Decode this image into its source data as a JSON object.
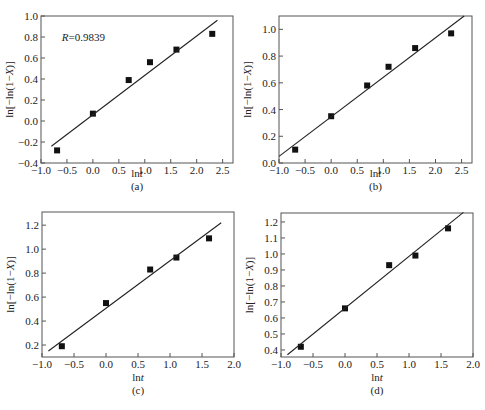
{
  "chart_data": [
    {
      "type": "scatter",
      "panel": "(a)",
      "xlabel": "lnt",
      "ylabel": "ln[−ln(1−X)]",
      "xlim": [
        -1.0,
        2.7
      ],
      "ylim": [
        -0.4,
        1.0
      ],
      "xticks": [
        -1.0,
        -0.5,
        0.0,
        0.5,
        1.0,
        1.5,
        2.0,
        2.5
      ],
      "xtick_labels": [
        "−1.0",
        "−0.5",
        "0.0",
        "0.5",
        "1.0",
        "1.5",
        "2.0",
        "2.5"
      ],
      "yticks": [
        -0.4,
        -0.2,
        0.0,
        0.2,
        0.4,
        0.6,
        0.8,
        1.0
      ],
      "ytick_labels": [
        "−0.4",
        "−0.2",
        "0.0",
        "0.2",
        "0.4",
        "0.6",
        "0.8",
        "1.0"
      ],
      "annotation": "R=0.9839",
      "annotation_pos": [
        -0.6,
        0.8
      ],
      "series": [
        {
          "name": "data",
          "marker": "square",
          "x": [
            -0.69,
            0.0,
            0.69,
            1.1,
            1.61,
            2.3
          ],
          "y": [
            -0.28,
            0.07,
            0.39,
            0.56,
            0.68,
            0.83
          ]
        },
        {
          "name": "linear fit",
          "style": "line",
          "x": [
            -0.8,
            2.4
          ],
          "y": [
            -0.24,
            0.96
          ]
        }
      ],
      "grid": false,
      "legend": "none"
    },
    {
      "type": "scatter",
      "panel": "(b)",
      "xlabel": "lnt",
      "ylabel": "ln[−ln(1−X)]",
      "xlim": [
        -1.0,
        2.7
      ],
      "ylim": [
        0.0,
        1.1
      ],
      "xticks": [
        -1.0,
        -0.5,
        0.0,
        0.5,
        1.0,
        1.5,
        2.0,
        2.5
      ],
      "xtick_labels": [
        "−1.0",
        "−0.5",
        "0.0",
        "0.5",
        "1.0",
        "1.5",
        "2.0",
        "2.5"
      ],
      "yticks": [
        0.0,
        0.2,
        0.4,
        0.6,
        0.8,
        1.0
      ],
      "ytick_labels": [
        "0.0",
        "0.2",
        "0.4",
        "0.6",
        "0.8",
        "1.0"
      ],
      "series": [
        {
          "name": "data",
          "marker": "square",
          "x": [
            -0.69,
            0.0,
            0.69,
            1.1,
            1.61,
            2.3
          ],
          "y": [
            0.1,
            0.35,
            0.58,
            0.72,
            0.86,
            0.97
          ]
        },
        {
          "name": "linear fit",
          "style": "line",
          "x": [
            -1.0,
            2.55
          ],
          "y": [
            0.05,
            1.1
          ]
        }
      ],
      "grid": false,
      "legend": "none"
    },
    {
      "type": "scatter",
      "panel": "(c)",
      "xlabel": "lnt",
      "ylabel": "ln[−ln(1−X)]",
      "xlim": [
        -1.0,
        2.0
      ],
      "ylim": [
        0.1,
        1.31
      ],
      "xticks": [
        -1.0,
        -0.5,
        0.0,
        0.5,
        1.0,
        1.5,
        2.0
      ],
      "xtick_labels": [
        "−1.0",
        "−0.5",
        "0.0",
        "0.5",
        "1.0",
        "1.5",
        "2.0"
      ],
      "yticks": [
        0.2,
        0.4,
        0.6,
        0.8,
        1.0,
        1.2
      ],
      "ytick_labels": [
        "0.2",
        "0.4",
        "0.6",
        "0.8",
        "1.0",
        "1.2"
      ],
      "series": [
        {
          "name": "data",
          "marker": "square",
          "x": [
            -0.69,
            0.0,
            0.69,
            1.1,
            1.61
          ],
          "y": [
            0.19,
            0.55,
            0.83,
            0.93,
            1.09
          ]
        },
        {
          "name": "linear fit",
          "style": "line",
          "x": [
            -0.9,
            1.8
          ],
          "y": [
            0.15,
            1.22
          ]
        }
      ],
      "grid": false,
      "legend": "none"
    },
    {
      "type": "scatter",
      "panel": "(d)",
      "xlabel": "lnt",
      "ylabel": "ln[−ln(1−X)]",
      "xlim": [
        -1.0,
        2.0
      ],
      "ylim": [
        0.356,
        1.256
      ],
      "xticks": [
        -1.0,
        -0.5,
        0.0,
        0.5,
        1.0,
        1.5,
        2.0
      ],
      "xtick_labels": [
        "−1.0",
        "−0.5",
        "0.0",
        "0.5",
        "1.0",
        "1.5",
        "2.0"
      ],
      "yticks": [
        0.4,
        0.5,
        0.6,
        0.7,
        0.8,
        0.9,
        1.0,
        1.1,
        1.2
      ],
      "ytick_labels": [
        "0.4",
        "0.5",
        "0.6",
        "0.7",
        "0.8",
        "0.9",
        "1.0",
        "1.1",
        "1.2"
      ],
      "series": [
        {
          "name": "data",
          "marker": "square",
          "x": [
            -0.69,
            0.0,
            0.69,
            1.1,
            1.61
          ],
          "y": [
            0.42,
            0.66,
            0.93,
            0.99,
            1.16
          ]
        },
        {
          "name": "linear fit",
          "style": "line",
          "x": [
            -0.9,
            1.85
          ],
          "y": [
            0.37,
            1.26
          ]
        }
      ],
      "grid": false,
      "legend": "none"
    }
  ],
  "layout": [
    {
      "box": [
        41,
        16,
        233,
        163
      ],
      "caption_y": 190,
      "xlabel_y": 177
    },
    {
      "box": [
        279,
        16,
        472,
        163
      ],
      "caption_y": 190,
      "xlabel_y": 177
    },
    {
      "box": [
        42,
        212,
        234,
        357
      ],
      "caption_y": 394,
      "xlabel_y": 381
    },
    {
      "box": [
        281,
        213,
        473,
        357
      ],
      "caption_y": 394,
      "xlabel_y": 381
    }
  ],
  "colors": {
    "axis": "#555555",
    "marker": "#111111",
    "line": "#222222",
    "text": "#222222"
  }
}
